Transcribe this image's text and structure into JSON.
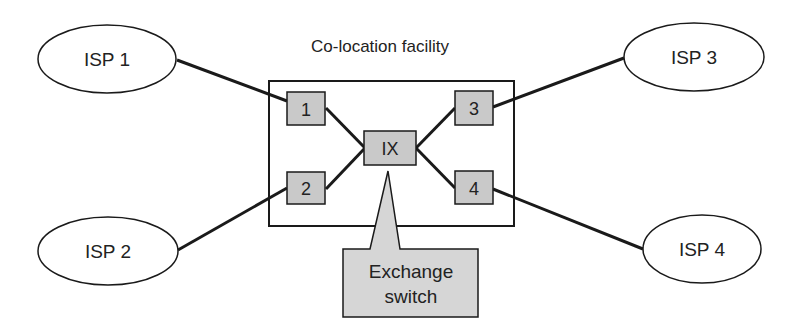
{
  "title": "Co-location facility",
  "colors": {
    "line": "#1a1a1a",
    "box_fill": "#c9c9c9",
    "callout_fill": "#d6d6d6",
    "background": "#ffffff"
  },
  "isps": [
    {
      "id": "isp1",
      "label": "ISP 1"
    },
    {
      "id": "isp2",
      "label": "ISP 2"
    },
    {
      "id": "isp3",
      "label": "ISP 3"
    },
    {
      "id": "isp4",
      "label": "ISP 4"
    }
  ],
  "ports": [
    {
      "id": "port1",
      "label": "1"
    },
    {
      "id": "port2",
      "label": "2"
    },
    {
      "id": "port3",
      "label": "3"
    },
    {
      "id": "port4",
      "label": "4"
    }
  ],
  "exchange": {
    "label": "IX"
  },
  "callout": {
    "line1": "Exchange",
    "line2": "switch"
  },
  "connections": [
    [
      "ISP 1",
      "1"
    ],
    [
      "ISP 2",
      "2"
    ],
    [
      "ISP 3",
      "3"
    ],
    [
      "ISP 4",
      "4"
    ],
    [
      "1",
      "IX"
    ],
    [
      "2",
      "IX"
    ],
    [
      "3",
      "IX"
    ],
    [
      "4",
      "IX"
    ]
  ]
}
